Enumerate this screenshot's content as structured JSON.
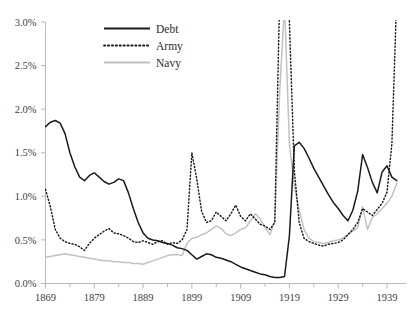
{
  "figure": {
    "clipped_header_text": "",
    "background_color": "#ffffff"
  },
  "chart_data": {
    "type": "line",
    "title": "",
    "subtitle": "",
    "xlabel": "",
    "ylabel": "",
    "xlim": [
      1869,
      1941
    ],
    "ylim": [
      0.0,
      3.0
    ],
    "y_tick_labels": [
      "0.0%",
      "0.5%",
      "1.0%",
      "1.5%",
      "2.0%",
      "2.5%",
      "3.0%"
    ],
    "y_tick_values": [
      0.0,
      0.5,
      1.0,
      1.5,
      2.0,
      2.5,
      3.0
    ],
    "x_tick_labels": [
      "1869",
      "1879",
      "1889",
      "1899",
      "1909",
      "1919",
      "1929",
      "1939"
    ],
    "x_tick_values": [
      1869,
      1879,
      1889,
      1899,
      1909,
      1919,
      1929,
      1939
    ],
    "grid": false,
    "legend_position": "top-center",
    "units": "percent",
    "value_clipping_note": "Army and Navy peaks during 1917-1919 and Army in 1941 exceed the 3.0% axis maximum and are drawn clipped at the plot top.",
    "legend": [
      {
        "name": "Debt",
        "style": "solid",
        "color": "#1a1a1a",
        "width": 1.5
      },
      {
        "name": "Army",
        "style": "dotted",
        "color": "#1a1a1a",
        "width": 1.45
      },
      {
        "name": "Navy",
        "style": "solid",
        "color": "#c2c2c2",
        "width": 1.5
      }
    ],
    "x": [
      1869,
      1870,
      1871,
      1872,
      1873,
      1874,
      1875,
      1876,
      1877,
      1878,
      1879,
      1880,
      1881,
      1882,
      1883,
      1884,
      1885,
      1886,
      1887,
      1888,
      1889,
      1890,
      1891,
      1892,
      1893,
      1894,
      1895,
      1896,
      1897,
      1898,
      1899,
      1900,
      1901,
      1902,
      1903,
      1904,
      1905,
      1906,
      1907,
      1908,
      1909,
      1910,
      1911,
      1912,
      1913,
      1914,
      1915,
      1916,
      1917,
      1918,
      1919,
      1920,
      1921,
      1922,
      1923,
      1924,
      1925,
      1926,
      1927,
      1928,
      1929,
      1930,
      1931,
      1932,
      1933,
      1934,
      1935,
      1936,
      1937,
      1938,
      1939,
      1940,
      1941
    ],
    "series": [
      {
        "name": "Debt",
        "values": [
          1.8,
          1.85,
          1.87,
          1.84,
          1.72,
          1.5,
          1.34,
          1.22,
          1.18,
          1.24,
          1.27,
          1.22,
          1.17,
          1.14,
          1.16,
          1.2,
          1.18,
          1.04,
          0.86,
          0.7,
          0.58,
          0.52,
          0.5,
          0.49,
          0.47,
          0.46,
          0.44,
          0.41,
          0.4,
          0.38,
          0.33,
          0.28,
          0.31,
          0.34,
          0.33,
          0.3,
          0.29,
          0.27,
          0.25,
          0.22,
          0.19,
          0.17,
          0.15,
          0.13,
          0.11,
          0.1,
          0.08,
          0.07,
          0.07,
          0.08,
          0.55,
          1.58,
          1.62,
          1.55,
          1.44,
          1.32,
          1.22,
          1.12,
          1.02,
          0.93,
          0.86,
          0.78,
          0.72,
          0.84,
          1.06,
          1.48,
          1.33,
          1.16,
          1.04,
          1.28,
          1.35,
          1.22,
          1.18
        ]
      },
      {
        "name": "Army",
        "values": [
          1.08,
          0.88,
          0.62,
          0.52,
          0.48,
          0.46,
          0.45,
          0.42,
          0.38,
          0.46,
          0.52,
          0.56,
          0.6,
          0.63,
          0.58,
          0.57,
          0.55,
          0.52,
          0.48,
          0.47,
          0.49,
          0.47,
          0.45,
          0.48,
          0.49,
          0.45,
          0.47,
          0.46,
          0.5,
          0.62,
          1.5,
          1.2,
          0.83,
          0.7,
          0.72,
          0.82,
          0.77,
          0.72,
          0.8,
          0.9,
          0.77,
          0.72,
          0.8,
          0.74,
          0.68,
          0.66,
          0.62,
          0.7,
          3.3,
          4.2,
          3.0,
          1.3,
          0.7,
          0.52,
          0.48,
          0.46,
          0.44,
          0.43,
          0.45,
          0.46,
          0.47,
          0.5,
          0.56,
          0.62,
          0.7,
          0.86,
          0.82,
          0.78,
          0.85,
          0.92,
          1.05,
          1.6,
          3.3
        ]
      },
      {
        "name": "Navy",
        "values": [
          0.3,
          0.31,
          0.32,
          0.33,
          0.34,
          0.33,
          0.32,
          0.31,
          0.3,
          0.29,
          0.28,
          0.27,
          0.26,
          0.26,
          0.25,
          0.25,
          0.24,
          0.24,
          0.23,
          0.23,
          0.22,
          0.24,
          0.26,
          0.28,
          0.3,
          0.32,
          0.33,
          0.33,
          0.32,
          0.46,
          0.52,
          0.53,
          0.56,
          0.58,
          0.62,
          0.66,
          0.63,
          0.57,
          0.55,
          0.58,
          0.62,
          0.64,
          0.72,
          0.8,
          0.74,
          0.64,
          0.56,
          0.72,
          2.2,
          3.2,
          1.6,
          1.12,
          0.84,
          0.62,
          0.52,
          0.48,
          0.47,
          0.46,
          0.47,
          0.49,
          0.5,
          0.52,
          0.56,
          0.6,
          0.64,
          0.88,
          0.62,
          0.76,
          0.8,
          0.86,
          0.92,
          1.0,
          1.15
        ]
      }
    ]
  }
}
